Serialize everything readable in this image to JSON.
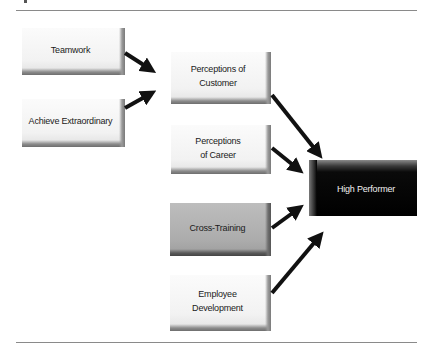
{
  "figure": {
    "nodes": [
      {
        "id": "teamwork",
        "label": "Teamwork",
        "style": "light"
      },
      {
        "id": "achieve",
        "label": "Achieve Extraordinary",
        "style": "light"
      },
      {
        "id": "customer",
        "label": "Perceptions of\nCustomer",
        "style": "light"
      },
      {
        "id": "career",
        "label": "Perceptions\nof Career",
        "style": "light"
      },
      {
        "id": "crosstraining",
        "label": "Cross-Training",
        "style": "gray"
      },
      {
        "id": "development",
        "label": "Employee\nDevelopment",
        "style": "light"
      },
      {
        "id": "performer",
        "label": "High Performer",
        "style": "dark"
      }
    ],
    "edges": [
      {
        "from": "teamwork",
        "to": "customer"
      },
      {
        "from": "achieve",
        "to": "customer"
      },
      {
        "from": "customer",
        "to": "performer"
      },
      {
        "from": "career",
        "to": "performer"
      },
      {
        "from": "crosstraining",
        "to": "performer"
      },
      {
        "from": "development",
        "to": "performer"
      }
    ],
    "colors": {
      "arrow": "#111111",
      "light_box": "#f2f2f2",
      "gray_box": "#acacac",
      "dark_box": "#000000",
      "dark_text": "#f0f0f0"
    }
  }
}
